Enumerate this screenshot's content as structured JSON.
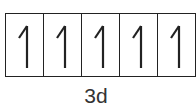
{
  "diagram": {
    "type": "orbital-box-diagram",
    "orbital_label": "3d",
    "boxes": [
      {
        "electrons": [
          "up"
        ]
      },
      {
        "electrons": [
          "up"
        ]
      },
      {
        "electrons": [
          "up"
        ]
      },
      {
        "electrons": [
          "up"
        ]
      },
      {
        "electrons": [
          "up"
        ]
      }
    ],
    "arrow_icon": "half-arrow-up",
    "line_color": "#222222"
  }
}
